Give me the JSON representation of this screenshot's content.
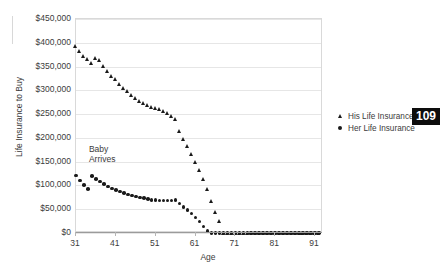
{
  "page": {
    "badge_number": "109"
  },
  "chart_data": {
    "type": "scatter",
    "title": "",
    "xlabel": "Age",
    "ylabel": "Life Insurance to Buy",
    "xlim": [
      31,
      93
    ],
    "ylim": [
      0,
      450000
    ],
    "xticks": [
      31,
      41,
      51,
      61,
      71,
      81,
      91
    ],
    "xtick_labels": [
      "31",
      "41",
      "51",
      "61",
      "71",
      "81",
      "91"
    ],
    "yticks": [
      0,
      50000,
      100000,
      150000,
      200000,
      250000,
      300000,
      350000,
      400000,
      450000
    ],
    "ytick_labels": [
      "$0",
      "$50,000",
      "$100,000",
      "$150,000",
      "$200,000",
      "$250,000",
      "$300,000",
      "$350,000",
      "$400,000",
      "$450,000"
    ],
    "grid": true,
    "grid_axis": "y",
    "legend_position": "right",
    "annotations": [
      {
        "text": "Baby\nArrives",
        "x": 34,
        "y": 172000
      }
    ],
    "series": [
      {
        "name": "His Life Insurance",
        "marker": "triangle",
        "color": "#1a1a1a",
        "x": [
          31,
          32,
          33,
          34,
          35,
          36,
          37,
          38,
          39,
          40,
          41,
          42,
          43,
          44,
          45,
          46,
          47,
          48,
          49,
          50,
          51,
          52,
          53,
          54,
          55,
          56,
          57,
          58,
          59,
          60,
          61,
          62,
          63,
          64,
          65,
          66,
          67,
          68,
          69,
          70,
          71,
          72,
          73,
          74,
          75,
          76,
          77,
          78,
          79,
          80,
          81,
          82,
          83,
          84,
          85,
          86,
          87,
          88,
          89,
          90,
          91,
          92
        ],
        "y": [
          392000,
          381000,
          372000,
          366000,
          357000,
          368000,
          362000,
          351000,
          340000,
          330000,
          322000,
          313000,
          304000,
          297000,
          290000,
          283000,
          277000,
          272000,
          268000,
          265000,
          262000,
          259000,
          256000,
          252000,
          246000,
          238000,
          213000,
          196000,
          182000,
          166000,
          149000,
          131000,
          112000,
          91000,
          67000,
          44000,
          24000,
          0,
          0,
          0,
          0,
          0,
          0,
          0,
          0,
          0,
          0,
          0,
          0,
          0,
          0,
          0,
          0,
          0,
          0,
          0,
          0,
          0,
          0,
          0,
          0,
          0
        ]
      },
      {
        "name": "Her Life Insurance",
        "marker": "circle",
        "color": "#1a1a1a",
        "x": [
          31,
          32,
          33,
          34,
          35,
          36,
          37,
          38,
          39,
          40,
          41,
          42,
          43,
          44,
          45,
          46,
          47,
          48,
          49,
          50,
          51,
          52,
          53,
          54,
          55,
          56,
          57,
          58,
          59,
          60,
          61,
          62,
          63,
          64,
          65,
          66,
          67,
          68,
          69,
          70,
          71,
          72,
          73,
          74,
          75,
          76,
          77,
          78,
          79,
          80,
          81,
          82,
          83,
          84,
          85,
          86,
          87,
          88,
          89,
          90,
          91,
          92
        ],
        "y": [
          121000,
          110000,
          101000,
          92000,
          120000,
          114000,
          108000,
          103000,
          98000,
          94000,
          90000,
          87000,
          84000,
          81000,
          79000,
          77000,
          75000,
          73000,
          72000,
          70000,
          69000,
          68000,
          68000,
          68000,
          68000,
          70000,
          62000,
          55000,
          48000,
          41000,
          33000,
          24000,
          14000,
          4000,
          0,
          0,
          0,
          0,
          0,
          0,
          0,
          0,
          0,
          0,
          0,
          0,
          0,
          0,
          0,
          0,
          0,
          0,
          0,
          0,
          0,
          0,
          0,
          0,
          0,
          0,
          0,
          0
        ]
      }
    ]
  }
}
